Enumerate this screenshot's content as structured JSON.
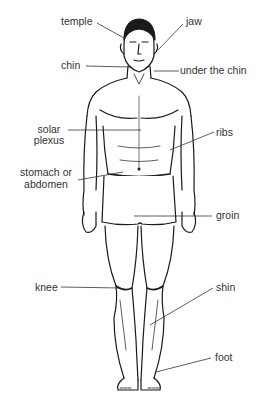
{
  "diagram": {
    "type": "anatomical-labelled-figure",
    "colors": {
      "background": "#ffffff",
      "ink": "#1a1a1a",
      "label": "#333333",
      "leader": "#333333"
    },
    "labels": {
      "temple": "temple",
      "jaw": "jaw",
      "chin": "chin",
      "under_chin": "under the chin",
      "solar_plexus_1": "solar",
      "solar_plexus_2": "plexus",
      "ribs": "ribs",
      "stomach_1": "stomach or",
      "stomach_2": "abdomen",
      "groin": "groin",
      "knee": "knee",
      "shin": "shin",
      "foot": "foot"
    }
  }
}
